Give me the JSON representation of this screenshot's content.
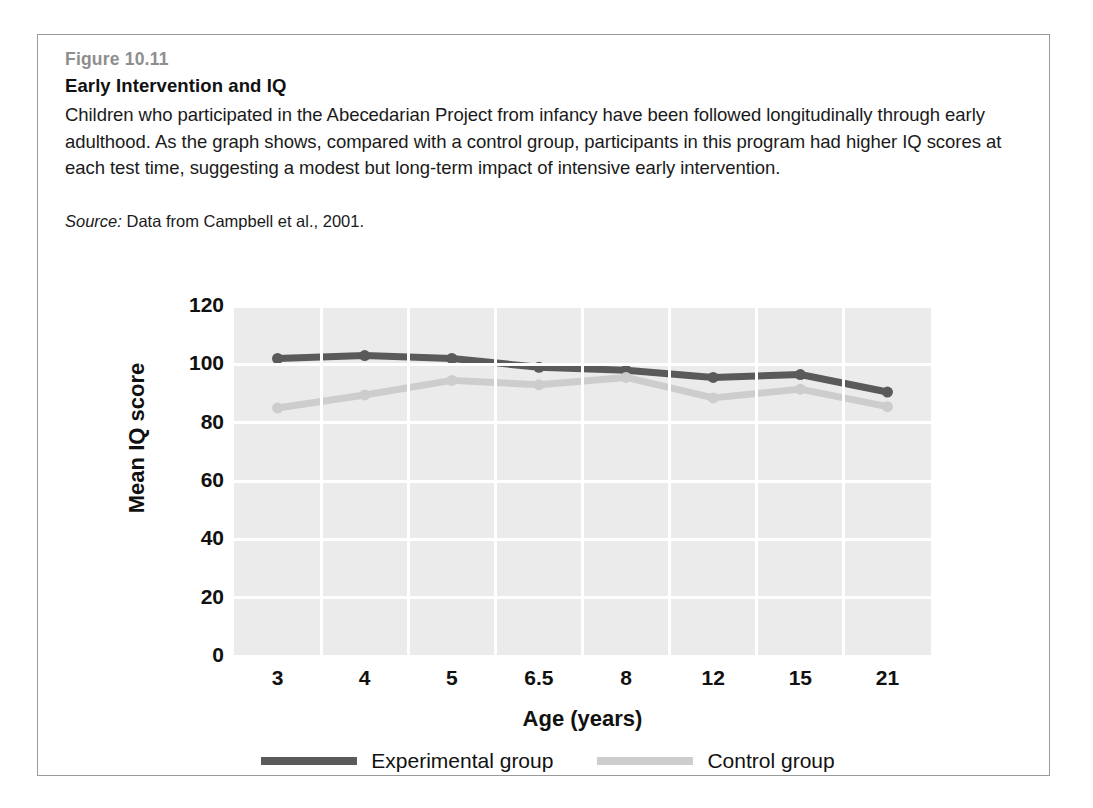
{
  "figure": {
    "number": "Figure 10.11",
    "title": "Early Intervention and IQ",
    "caption": "Children who participated in the Abecedarian Project from infancy have been followed longitudinally through early adulthood. As the graph shows, compared with a control group, participants in this program had higher IQ scores at each test time, suggesting a modest but long-term impact of intensive early intervention.",
    "source_label": "Source:",
    "source_text": " Data from Campbell et al., 2001."
  },
  "chart_data": {
    "type": "line",
    "title": "Early Intervention and IQ",
    "xlabel": "Age (years)",
    "ylabel": "Mean IQ score",
    "categories": [
      "3",
      "4",
      "5",
      "6.5",
      "8",
      "12",
      "15",
      "21"
    ],
    "ylim": [
      0,
      120
    ],
    "yticks": [
      "0",
      "20",
      "40",
      "60",
      "80",
      "100",
      "120"
    ],
    "ytick_values": [
      0,
      20,
      40,
      60,
      80,
      100,
      120
    ],
    "grid": true,
    "legend_position": "bottom",
    "plot_background": "#ebebeb",
    "gridline_color": "#ffffff",
    "series": [
      {
        "name": "Experimental group",
        "color": "#5a5a5a",
        "values": [
          102,
          103,
          102,
          99,
          98,
          95.5,
          96.5,
          90.5
        ]
      },
      {
        "name": "Control group",
        "color": "#cdcdcd",
        "values": [
          85,
          89.5,
          94.5,
          93,
          95.5,
          88.5,
          91.5,
          85.5
        ]
      }
    ]
  }
}
